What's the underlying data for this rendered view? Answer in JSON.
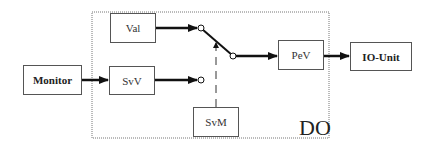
{
  "diagram": {
    "container": {
      "label": "DO"
    },
    "blocks": [
      {
        "id": "monitor",
        "label": "Monitor"
      },
      {
        "id": "val",
        "label": "Val"
      },
      {
        "id": "svv",
        "label": "SvV"
      },
      {
        "id": "svm",
        "label": "SvM"
      },
      {
        "id": "pev",
        "label": "PeV"
      },
      {
        "id": "io_unit",
        "label": "IO-Unit"
      }
    ],
    "connections": [
      {
        "from": "Monitor",
        "to": "SvV",
        "style": "solid-arrow"
      },
      {
        "from": "Val",
        "to": "switch-input-1",
        "style": "solid-arrow"
      },
      {
        "from": "SvV",
        "to": "switch-input-2",
        "style": "solid-arrow"
      },
      {
        "from": "switch-output",
        "to": "PeV",
        "style": "solid-arrow"
      },
      {
        "from": "PeV",
        "to": "IO-Unit",
        "style": "solid-arrow"
      },
      {
        "from": "SvM",
        "to": "switch",
        "style": "dashed-arrow"
      }
    ]
  }
}
